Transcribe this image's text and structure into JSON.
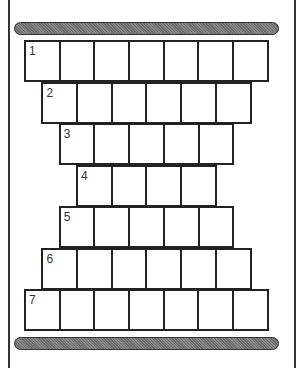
{
  "diagram": {
    "type": "stacked-cell-grid",
    "top_bar": "top-shaded-bar",
    "bottom_bar": "bottom-shaded-bar",
    "rows": [
      {
        "label": "1",
        "cells": 7
      },
      {
        "label": "2",
        "cells": 6
      },
      {
        "label": "3",
        "cells": 5
      },
      {
        "label": "4",
        "cells": 4
      },
      {
        "label": "5",
        "cells": 5
      },
      {
        "label": "6",
        "cells": 6
      },
      {
        "label": "7",
        "cells": 7
      }
    ],
    "colors": {
      "line": "#222222",
      "bar_fill": "#7a7a7a",
      "background": "#ffffff"
    }
  }
}
